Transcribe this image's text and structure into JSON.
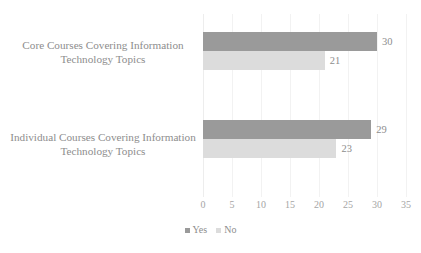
{
  "chart_data": {
    "type": "bar",
    "orientation": "horizontal",
    "grouped": true,
    "title": "",
    "xlabel": "",
    "ylabel": "",
    "categories": [
      "Core Courses Covering Information Technology Topics",
      "Individual Courses Covering Information Technology Topics"
    ],
    "series": [
      {
        "name": "Yes",
        "color": "#9a9a9a",
        "values": [
          30,
          29
        ]
      },
      {
        "name": "No",
        "color": "#dcdcdc",
        "values": [
          21,
          23
        ]
      }
    ],
    "data_labels": [
      {
        "series": "Yes",
        "category_index": 0,
        "text": "30"
      },
      {
        "series": "No",
        "category_index": 0,
        "text": "21"
      },
      {
        "series": "Yes",
        "category_index": 1,
        "text": "29"
      },
      {
        "series": "No",
        "category_index": 1,
        "text": "23"
      }
    ],
    "xlim": [
      0,
      35
    ],
    "xticks": [
      0,
      5,
      10,
      15,
      20,
      25,
      30,
      35
    ],
    "xtick_labels": [
      "0",
      "5",
      "10",
      "15",
      "20",
      "25",
      "30",
      "35"
    ],
    "grid": true,
    "grid_axis": "x",
    "legend": {
      "position": "bottom",
      "entries": [
        {
          "label": "Yes",
          "color": "#9a9a9a"
        },
        {
          "label": "No",
          "color": "#dcdcdc"
        }
      ]
    }
  },
  "colors": {
    "yes": "#9a9a9a",
    "no": "#dcdcdc",
    "text": "#8d8d8d",
    "tick_text": "#a5a5a5",
    "gridline": "#f2f2f2",
    "background": "#ffffff"
  }
}
